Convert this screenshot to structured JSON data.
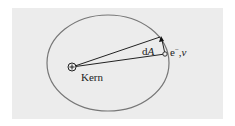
{
  "diagram": {
    "type": "atom-orbit",
    "nucleus_label": "Kern",
    "area_label_prefix": "d",
    "area_label_var": "A",
    "electron_label_prefix": "e",
    "electron_label_sup": "−",
    "electron_label_suffix": ",",
    "electron_label_var": "v",
    "nucleus_symbol": "+",
    "colors": {
      "background": "#ececec",
      "orbit": "#777777",
      "lines": "#222222"
    }
  }
}
